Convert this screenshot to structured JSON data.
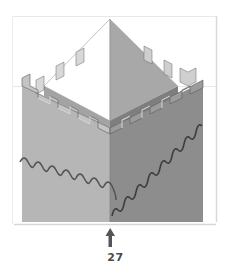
{
  "figure": {
    "parts": [
      {
        "name": "pyramid-roof",
        "faces": [
          "left-face-white",
          "right-face-gray"
        ]
      },
      {
        "name": "inner-wall-top-band"
      },
      {
        "name": "crenellated-parapet",
        "merlons_per_side_visible": 5
      },
      {
        "name": "tower-body",
        "faces": [
          "left-face-light-gray",
          "right-face-dark-gray"
        ]
      },
      {
        "name": "scalloped-bottom-edge"
      }
    ],
    "colors": {
      "background": "#ffffff",
      "frame_border": "#e4e4e4",
      "roof_left": "#ffffff",
      "roof_right": "#a9a9a9",
      "wall_left": "#b5b5b5",
      "wall_right": "#8c8c8c",
      "inner_wall": "#9a9a9a",
      "merlon_light": "#e6e6e6",
      "outline": "#555555",
      "arrow": "#555555"
    }
  },
  "annotation": {
    "arrow_direction": "up",
    "step_number": "27"
  }
}
